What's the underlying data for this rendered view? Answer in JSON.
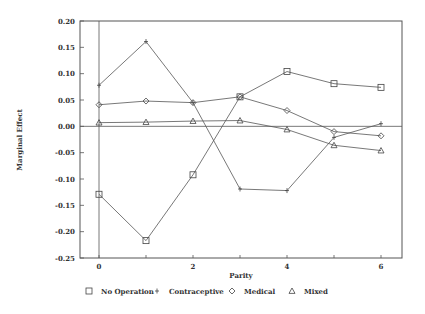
{
  "chart_data": {
    "type": "line",
    "title": "",
    "xlabel": "Parity",
    "ylabel": "Marginal Effect",
    "x": [
      0,
      1,
      2,
      3,
      4,
      5,
      6
    ],
    "xticks": [
      "0",
      "2",
      "4",
      "6"
    ],
    "yticks": [
      "0.20",
      "0.15",
      "0.10",
      "0.05",
      "0.00",
      "-0.05",
      "-0.10",
      "-0.15",
      "-0.20",
      "-0.25"
    ],
    "xlim": [
      -0.4,
      6.5
    ],
    "ylim": [
      -0.25,
      0.2
    ],
    "grid": false,
    "legend_position": "bottom",
    "series": [
      {
        "name": "No Operation",
        "marker": "square",
        "values": [
          -0.129,
          -0.217,
          -0.092,
          0.056,
          0.104,
          0.081,
          0.074
        ]
      },
      {
        "name": "Contraceptive",
        "marker": "plus",
        "values": [
          0.078,
          0.161,
          0.045,
          -0.119,
          -0.122,
          -0.021,
          0.005
        ]
      },
      {
        "name": "Medical",
        "marker": "diamond",
        "values": [
          0.041,
          0.048,
          0.045,
          0.056,
          0.03,
          -0.01,
          -0.018
        ]
      },
      {
        "name": "Mixed",
        "marker": "triangle",
        "values": [
          0.007,
          0.008,
          0.01,
          0.011,
          -0.006,
          -0.036,
          -0.046
        ]
      }
    ]
  },
  "legend": [
    {
      "symbol": "□",
      "label": "No Operation"
    },
    {
      "symbol": "+",
      "label": "Contraceptive"
    },
    {
      "symbol": "◇",
      "label": "Medical"
    },
    {
      "symbol": "△",
      "label": "Mixed"
    }
  ]
}
